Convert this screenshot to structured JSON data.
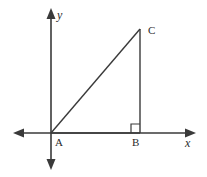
{
  "figure": {
    "width": 207,
    "height": 177,
    "background_color": "#ffffff",
    "stroke_color": "#3a3a3a",
    "label_color": "#2b2b2b"
  },
  "axes": {
    "x_axis": {
      "label": "x",
      "y_position": 133,
      "from_x": 13,
      "to_x": 196,
      "arrow_left": true,
      "arrow_right": true
    },
    "y_axis": {
      "label": "y",
      "x_position": 51,
      "from_y": 8,
      "to_y": 170,
      "arrow_up": true,
      "arrow_down": true
    },
    "origin": {
      "x": 51,
      "y": 133
    }
  },
  "triangle": {
    "vertices": [
      {
        "name": "A",
        "label": "A",
        "x": 51,
        "y": 133
      },
      {
        "name": "B",
        "label": "B",
        "x": 140,
        "y": 133
      },
      {
        "name": "C",
        "label": "C",
        "x": 140,
        "y": 29
      }
    ],
    "right_angle_at": "B",
    "right_angle_marker_size": 9,
    "sides": [
      {
        "name": "AB",
        "from": "A",
        "to": "B"
      },
      {
        "name": "BC",
        "from": "B",
        "to": "C"
      },
      {
        "name": "AC",
        "from": "A",
        "to": "C"
      }
    ]
  }
}
